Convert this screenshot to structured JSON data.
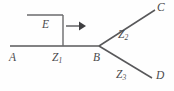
{
  "figure": {
    "type": "transmission-line-junction-diagram",
    "background_color": "#fefefe",
    "line_color": "#58585a",
    "label_color": "#4a4a4c",
    "nodes": {
      "A": "A",
      "B": "B",
      "C": "C",
      "D": "D"
    },
    "source": {
      "label": "E",
      "arrow_direction": "right"
    },
    "segments": {
      "z1_base": "Z",
      "z1_sub": "1",
      "z2_base": "Z",
      "z2_sub": "2",
      "z3_base": "Z",
      "z3_sub": "3"
    },
    "geometry": {
      "main_line": "M 10 46 L 99 46",
      "branch_upper": "M 99 46 L 155 10",
      "branch_lower": "M 99 46 L 152 78",
      "bracket_top": "M 27 15 L 63 15",
      "bracket_vertical": "M 63 15 L 63 46",
      "arrow_shaft": "M 66 26 L 79 26",
      "arrow_head": "79,21.5 86,26 79,30.5"
    }
  }
}
